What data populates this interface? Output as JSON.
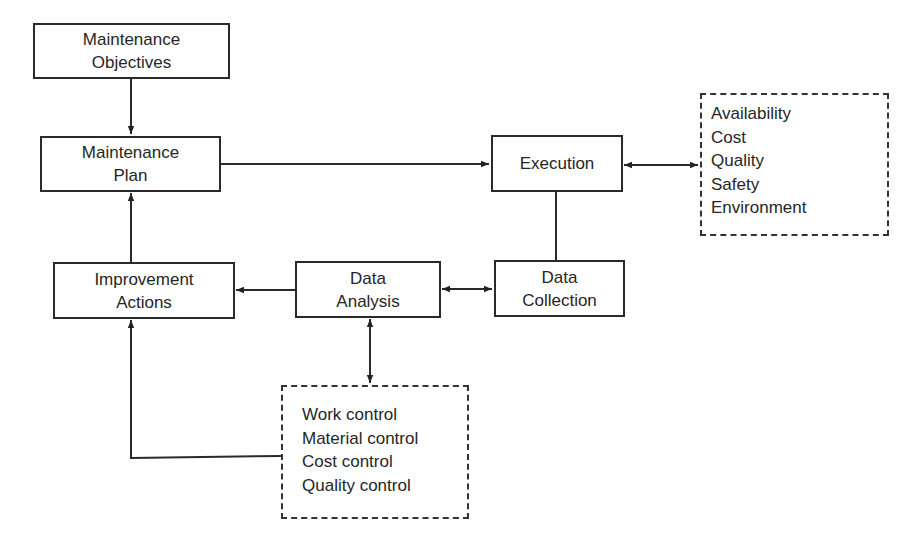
{
  "diagram": {
    "nodes": {
      "objectives": {
        "line1": "Maintenance",
        "line2": "Objectives"
      },
      "plan": {
        "line1": "Maintenance",
        "line2": "Plan"
      },
      "execution": {
        "line1": "Execution"
      },
      "data_collection": {
        "line1": "Data",
        "line2": "Collection"
      },
      "data_analysis": {
        "line1": "Data",
        "line2": "Analysis"
      },
      "improvement": {
        "line1": "Improvement",
        "line2": "Actions"
      }
    },
    "performance_list": [
      "Availability",
      "Cost",
      "Quality",
      "Safety",
      "Environment"
    ],
    "control_list": [
      "Work control",
      "Material control",
      "Cost control",
      "Quality control"
    ],
    "edges": [
      {
        "from": "Maintenance Objectives",
        "to": "Maintenance Plan",
        "type": "arrow"
      },
      {
        "from": "Maintenance Plan",
        "to": "Execution",
        "type": "arrow"
      },
      {
        "from": "Execution",
        "to": "Performance list",
        "type": "bidirectional"
      },
      {
        "from": "Execution",
        "to": "Data Collection",
        "type": "line"
      },
      {
        "from": "Data Collection",
        "to": "Data Analysis",
        "type": "bidirectional"
      },
      {
        "from": "Data Analysis",
        "to": "Improvement Actions",
        "type": "arrow"
      },
      {
        "from": "Data Analysis",
        "to": "Control list",
        "type": "bidirectional"
      },
      {
        "from": "Control list",
        "to": "Improvement Actions",
        "type": "arrow"
      },
      {
        "from": "Improvement Actions",
        "to": "Maintenance Plan",
        "type": "arrow"
      }
    ]
  }
}
